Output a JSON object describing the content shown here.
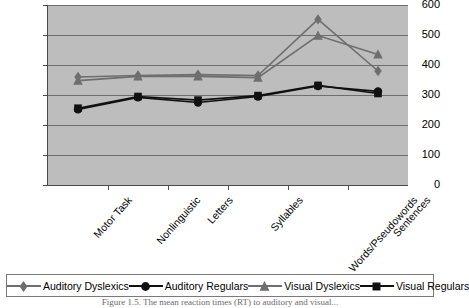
{
  "chart_data": {
    "type": "line",
    "title": "",
    "xlabel": "",
    "ylabel": "",
    "ylim": [
      0,
      600
    ],
    "yticks": [
      0,
      100,
      200,
      300,
      400,
      500,
      600
    ],
    "grid": true,
    "legend_position": "bottom",
    "categories": [
      "Motor Task",
      "Nonlinguistic",
      "Letters",
      "Syllables",
      "Words/Pseudowords",
      "Sentences"
    ],
    "series": [
      {
        "name": "Auditory Dyslexics",
        "marker": "diamond",
        "color": "#6e6e6e",
        "values": [
          360,
          365,
          368,
          365,
          552,
          380
        ]
      },
      {
        "name": "Auditory Regulars",
        "marker": "circle",
        "color": "#111111",
        "values": [
          252,
          292,
          275,
          295,
          330,
          312
        ]
      },
      {
        "name": "Visual Dyslexics",
        "marker": "triangle",
        "color": "#6e6e6e",
        "values": [
          348,
          362,
          362,
          358,
          498,
          435
        ]
      },
      {
        "name": "Visual Regulars",
        "marker": "square",
        "color": "#111111",
        "values": [
          256,
          295,
          283,
          298,
          332,
          305
        ]
      }
    ]
  },
  "legend": {
    "entries": [
      {
        "label": "Auditory Dyslexics",
        "marker": "diamond",
        "color": "#6e6e6e"
      },
      {
        "label": "Auditory Regulars",
        "marker": "circle",
        "color": "#111111"
      },
      {
        "label": "Visual Dyslexics",
        "marker": "triangle",
        "color": "#6e6e6e"
      },
      {
        "label": "Visual Regulars",
        "marker": "square",
        "color": "#111111"
      }
    ]
  },
  "caption": {
    "text": "Figure 1.5.   The mean reaction times (RT) to auditory and visual..."
  },
  "colors": {
    "plot_background": "#bdbdbd",
    "gridline": "#6e6e6e",
    "axis": "#4a4a4a",
    "gray_series": "#6e6e6e",
    "black_series": "#111111"
  }
}
